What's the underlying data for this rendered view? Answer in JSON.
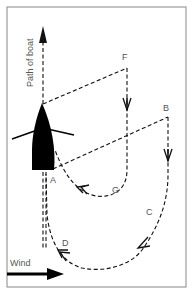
{
  "diagram": {
    "labels": {
      "path": "Path of boat",
      "a": "A",
      "b": "B",
      "c": "C",
      "d": "D",
      "f": "F",
      "g": "G",
      "wind": "Wind"
    },
    "icons": {
      "boat": "sailboat-hull-topview",
      "wind_arrow": "arrow-right",
      "path_arrow": "arrow-up"
    },
    "colors": {
      "frame": "#888888",
      "ink": "#111111",
      "text": "#555555",
      "background": "#ffffff"
    }
  }
}
